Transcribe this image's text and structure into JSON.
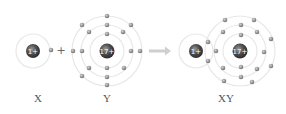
{
  "diagram": {
    "type": "ionic-bond-formation",
    "atoms": {
      "X": {
        "label": "X",
        "nucleus_label": "1+",
        "shells": [
          1
        ]
      },
      "Y": {
        "label": "Y",
        "nucleus_label": "17+",
        "shells": [
          2,
          8,
          7
        ]
      },
      "XY": {
        "label": "XY",
        "nucleus_labels": [
          "1+",
          "17+"
        ]
      }
    },
    "operator_plus": "+",
    "arrow": "yields"
  },
  "colors": {
    "nucleus": "#4a4a4a",
    "electron": "#8a8a8a",
    "orbit": "#e6e6e6",
    "arrow": "#cccccc",
    "label": "#555555"
  }
}
